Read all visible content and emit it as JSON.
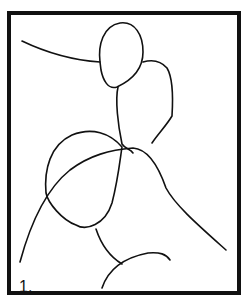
{
  "figure": {
    "label": "1.",
    "frame_color": "#111111",
    "stroke_color": "#111111",
    "background": "#ffffff"
  }
}
